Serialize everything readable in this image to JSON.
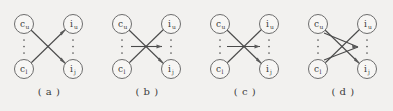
{
  "figure": {
    "background_color": "#f2f1ef",
    "stroke_color": "#4a4a4a",
    "node_fill_color": "#f7f6f4",
    "node_stroke_color": "#6d6d6d",
    "panel_count": 4
  },
  "nodes": {
    "left_top": {
      "base": "c",
      "sub": "u",
      "full": "c_u"
    },
    "left_bottom": {
      "base": "c",
      "sub": "l",
      "full": "c_l"
    },
    "right_top": {
      "base": "i",
      "sub": "u",
      "full": "i_u"
    },
    "right_bottom": {
      "base": "i",
      "sub": "j",
      "full": "i_j"
    },
    "ellipsis": "⋮"
  },
  "panels": [
    {
      "id": "a",
      "caption": "( a )",
      "nodes": [
        "c_u",
        "c_l",
        "i_u",
        "i_j"
      ],
      "edges": [
        {
          "from": "c_u",
          "to": "i_j",
          "arrow": true
        },
        {
          "from": "c_l",
          "to": "i_u",
          "arrow": true
        }
      ],
      "extra_arrows": []
    },
    {
      "id": "b",
      "caption": "( b )",
      "nodes": [
        "c_u",
        "c_l",
        "i_u",
        "i_j"
      ],
      "edges": [
        {
          "from": "c_u",
          "to": "i_j",
          "arrow": true
        },
        {
          "from": "c_l",
          "to": "i_u",
          "arrow": true
        }
      ],
      "extra_arrows": [
        {
          "kind": "horizontal",
          "direction": "right",
          "label": "mid-arrow"
        }
      ]
    },
    {
      "id": "c",
      "caption": "( c )",
      "nodes": [
        "c_u",
        "c_l",
        "i_u",
        "i_j"
      ],
      "edges": [
        {
          "from": "c_u",
          "to": "i_j",
          "arrow": true
        },
        {
          "from": "c_l",
          "to": "i_u",
          "arrow": true
        }
      ],
      "extra_arrows": [
        {
          "kind": "horizontal",
          "direction": "right",
          "label": "mid-arrow"
        }
      ]
    },
    {
      "id": "d",
      "caption": "( d )",
      "nodes": [
        "c_u",
        "c_l",
        "i_u",
        "i_j"
      ],
      "edges": [
        {
          "from": "c_u",
          "to": "i_j",
          "arrow": true
        },
        {
          "from": "c_l",
          "to": "i_u",
          "arrow": true
        }
      ],
      "extra_arrows": [
        {
          "kind": "diamond",
          "direction": "right",
          "label": "diamond-arrows"
        }
      ]
    }
  ]
}
